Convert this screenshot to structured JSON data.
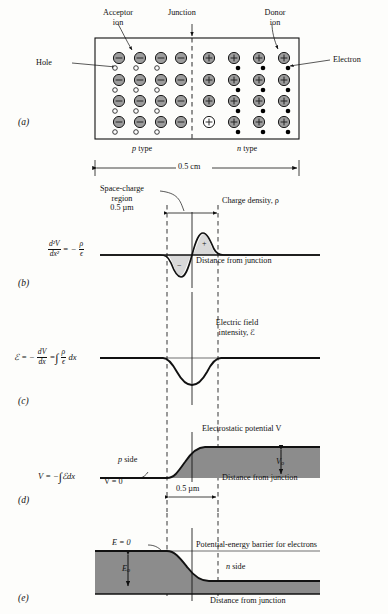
{
  "figure": {
    "panels": [
      "(a)",
      "(b)",
      "(c)",
      "(d)",
      "(e)"
    ]
  },
  "colors": {
    "ion_fill": "#9c9c9c",
    "ion_stroke": "#1a1a1a",
    "electron_fill": "#000000",
    "hole_fill": "#ffffff",
    "light_shade": "#d9d9d9",
    "dark_shade": "#8c8c8c",
    "line": "#111111",
    "dashed": "#111111",
    "background": "#fdfdfb"
  },
  "panel_a": {
    "id": "(a)",
    "label_acceptor": "Acceptor",
    "label_acceptor2": "ion",
    "label_junction": "Junction",
    "label_donor": "Donor",
    "label_donor2": "ion",
    "label_hole": "Hole",
    "label_electron": "Electron",
    "label_p_type": "p type",
    "label_n_type": "n type",
    "dimension": "0.5 cm",
    "acceptor_sign": "−",
    "donor_sign": "+",
    "p_rows": 4,
    "p_cols": 4,
    "n_rows": 4,
    "n_cols": 4
  },
  "panel_b": {
    "id": "(b)",
    "equation_lhs_num": "d²V",
    "equation_lhs_den": "dx²",
    "equation_eq": "= −",
    "equation_rhs_num": "ρ",
    "equation_rhs_den": "ϵ",
    "label_space_charge1": "Space-charge",
    "label_space_charge2": "region",
    "label_space_charge3": "0.5 µm",
    "label_charge_density": "Charge density, ρ",
    "label_axis": "Distance from junction",
    "sign_negative": "−",
    "sign_positive": "+"
  },
  "panel_c": {
    "id": "(c)",
    "equation": "ℰ = − dV/dx = ∫ (ρ/ϵ) dx",
    "eq_lead": "ℰ =  −",
    "eq_num1": "dV",
    "eq_den1": "dx",
    "eq_mid": "=",
    "eq_num2": "ρ",
    "eq_den2": "ϵ",
    "eq_tail": "dx",
    "label_field1": "Electric field",
    "label_field2": "intensity, ℰ"
  },
  "panel_d": {
    "id": "(d)",
    "eq_lead": "V = −",
    "eq_tail": "ℰdx",
    "label_potential": "Electrostatic potential V",
    "label_p_side": "p side",
    "label_v_zero": "V = 0",
    "label_v0": "V",
    "label_v0_sub": "o",
    "label_width": "0.5 µm",
    "label_axis": "Distance from junction"
  },
  "panel_e": {
    "id": "(e)",
    "label_e_zero": "E = 0",
    "label_barrier": "Potential-energy barrier for electrons",
    "label_n_side": "n side",
    "label_e0": "E",
    "label_e0_sub": "o",
    "label_axis": "Distance from junction"
  }
}
